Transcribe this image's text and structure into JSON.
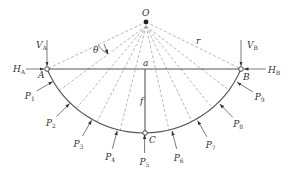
{
  "diagram": {
    "center_label": "O",
    "radius_label": "r",
    "angle_label": "θ",
    "support_left": {
      "label": "A",
      "vertical_reaction": "V",
      "vertical_sub": "A",
      "horizontal_reaction": "H",
      "horizontal_sub": "A"
    },
    "support_right": {
      "label": "B",
      "vertical_reaction": "V",
      "vertical_sub": "B",
      "horizontal_reaction": "H",
      "horizontal_sub": "B"
    },
    "crown_label": "C",
    "chord_mid_label": "a",
    "rise_label": "f",
    "loads": [
      {
        "label": "P",
        "sub": "1"
      },
      {
        "label": "P",
        "sub": "2"
      },
      {
        "label": "P",
        "sub": "3"
      },
      {
        "label": "P",
        "sub": "4"
      },
      {
        "label": "P",
        "sub": "5"
      },
      {
        "label": "P",
        "sub": "6"
      },
      {
        "label": "P",
        "sub": "7"
      },
      {
        "label": "P",
        "sub": "8"
      },
      {
        "label": "P",
        "sub": "9"
      }
    ]
  }
}
